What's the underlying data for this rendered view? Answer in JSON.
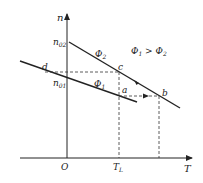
{
  "diagram": {
    "type": "motor-mechanical-characteristic",
    "axes": {
      "y_label": "n",
      "x_label": "T",
      "origin_label": "O"
    },
    "condition_label": {
      "phi1": "Φ",
      "sub1": "1",
      "op": " > ",
      "phi2": "Φ",
      "sub2": "2"
    },
    "lines": [
      {
        "name": "Φ2",
        "symbol": "Φ",
        "sub": "2",
        "intercept_label": "n",
        "intercept_sub": "02"
      },
      {
        "name": "Φ1",
        "symbol": "Φ",
        "sub": "1",
        "intercept_label": "n",
        "intercept_sub": "01"
      }
    ],
    "points": {
      "a": "a",
      "b": "b",
      "c": "c",
      "d": "d"
    },
    "load_torque": {
      "label": "T",
      "sub": "L"
    },
    "colors": {
      "line": "#222222",
      "dashed": "#333333",
      "background": "#ffffff"
    }
  }
}
